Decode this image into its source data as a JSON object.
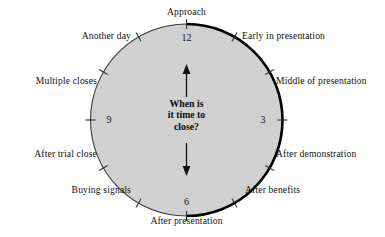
{
  "diagram": {
    "title_text": "When is\nit time to\nclose?",
    "center_question_lines": [
      "When is",
      "it time to",
      "close?"
    ],
    "face_fill_color": "#d2d2d2",
    "face_stroke_color": "#2b2b2b",
    "emphasis_arc_color": "#000000",
    "emphasis_arc_description": "thick arc from 12 o'clock clockwise to 6 o'clock",
    "numerals": [
      {
        "value": "12",
        "position": "top"
      },
      {
        "value": "3",
        "position": "right"
      },
      {
        "value": "6",
        "position": "bottom"
      },
      {
        "value": "9",
        "position": "left"
      }
    ],
    "arrows": [
      {
        "name": "up-arrow",
        "direction": "up"
      },
      {
        "name": "down-arrow",
        "direction": "down"
      }
    ],
    "labels": [
      {
        "id": "approach",
        "text": "Approach",
        "hour": 12,
        "side": "center-top"
      },
      {
        "id": "early-in-presentation",
        "text": "Early in presentation",
        "hour": 1,
        "side": "right"
      },
      {
        "id": "middle-of-presentation",
        "text": "Middle of presentation",
        "hour": 2,
        "side": "right"
      },
      {
        "id": "after-demonstration",
        "text": "After demonstration",
        "hour": 4,
        "side": "right"
      },
      {
        "id": "after-benefits",
        "text": "After benefits",
        "hour": 5,
        "side": "right"
      },
      {
        "id": "after-presentation",
        "text": "After presentation",
        "hour": 6,
        "side": "center-bottom"
      },
      {
        "id": "buying-signals",
        "text": "Buying signals",
        "hour": 7,
        "side": "left"
      },
      {
        "id": "after-trial-close",
        "text": "After trial close",
        "hour": 8,
        "side": "left"
      },
      {
        "id": "multiple-closes",
        "text": "Multiple closes",
        "hour": 10,
        "side": "left"
      },
      {
        "id": "another-day",
        "text": "Another day",
        "hour": 11,
        "side": "left"
      }
    ]
  }
}
